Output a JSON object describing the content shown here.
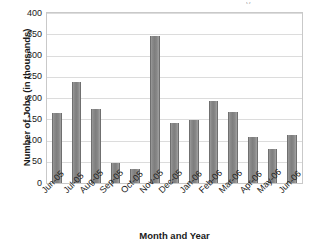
{
  "chart_data": {
    "type": "bar",
    "title": "",
    "xlabel": "Month and Year",
    "ylabel": "Number of Jobs (in thousands)",
    "categories": [
      "Jun-05",
      "Jul-05",
      "Aug-05",
      "Sep-05",
      "Oct-05",
      "Nov-05",
      "Dec-05",
      "Jan-06",
      "Feb-06",
      "Mar-06",
      "Apr-06",
      "May-06",
      "Jun-06"
    ],
    "values": [
      165,
      237,
      175,
      48,
      34,
      347,
      141,
      148,
      194,
      168,
      108,
      81,
      114
    ],
    "series": [
      {
        "name": "Number of Jobs",
        "values": [
          165,
          237,
          175,
          48,
          34,
          347,
          141,
          148,
          194,
          168,
          108,
          81,
          114
        ]
      }
    ],
    "ylim": [
      0,
      400
    ],
    "ytick_step": 50,
    "ytick_labels": [
      "400",
      "350",
      "300",
      "250",
      "200",
      "150",
      "100",
      "50",
      "0"
    ],
    "grid": "horizontal",
    "legend": "none",
    "bar_color": "#808080",
    "plot_border_color": "#c9c9c9",
    "gridline_color": "#dcdcdc"
  },
  "axes": {
    "y_title": "Number of Jobs (in thousands)",
    "x_title": "Month and Year"
  },
  "title_remnant": "y"
}
